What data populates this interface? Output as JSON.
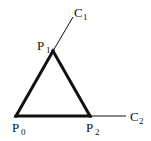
{
  "diagram": {
    "points": {
      "P0": {
        "label": "P",
        "sub": "0",
        "x": 16,
        "y": 116
      },
      "P1": {
        "label": "P",
        "sub": "1",
        "x": 53,
        "y": 51
      },
      "P2": {
        "label": "P",
        "sub": "2",
        "x": 90,
        "y": 116
      },
      "C1": {
        "label": "C",
        "sub": "1",
        "x": 73,
        "y": 17
      },
      "C2": {
        "label": "C",
        "sub": "2",
        "x": 126,
        "y": 116
      }
    },
    "triangle_edges": [
      [
        "P0",
        "P1"
      ],
      [
        "P1",
        "P2"
      ],
      [
        "P2",
        "P0"
      ]
    ],
    "tangent_lines": [
      [
        "P1",
        "C1"
      ],
      [
        "P2",
        "C2"
      ]
    ],
    "colors": {
      "stroke": "#111111",
      "background": "#ffffff"
    }
  }
}
